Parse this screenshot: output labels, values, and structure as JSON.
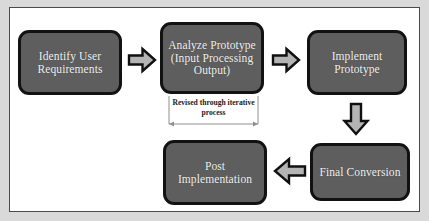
{
  "diagram": {
    "colors": {
      "node_fill": "#5e5e5e",
      "node_border": "#121212",
      "node_text": "#f2f2f2",
      "arrow_fill": "#b4b4b4",
      "arrow_outline": "#101010",
      "canvas": "#ffffff",
      "frame_border": "#4a4a4a",
      "page_background": "#d9d9d9"
    },
    "nodes": [
      {
        "id": "identify",
        "label": "Identify User Requirements"
      },
      {
        "id": "analyze",
        "label": "Analyze Prototype (Input Processing Output)"
      },
      {
        "id": "implement",
        "label": "Implement Prototype"
      },
      {
        "id": "final",
        "label": "Final Conversion"
      },
      {
        "id": "post",
        "label": "Post Implementation"
      }
    ],
    "annotations": [
      {
        "id": "feedback",
        "label": "Revised through iterative process"
      }
    ],
    "connectors": [
      {
        "id": "arrow-1",
        "direction": "right",
        "from": "identify",
        "to": "analyze"
      },
      {
        "id": "arrow-2",
        "direction": "right",
        "from": "analyze",
        "to": "implement"
      },
      {
        "id": "arrow-3",
        "direction": "down",
        "from": "implement",
        "to": "final"
      },
      {
        "id": "arrow-4",
        "direction": "left",
        "from": "final",
        "to": "post"
      }
    ]
  }
}
